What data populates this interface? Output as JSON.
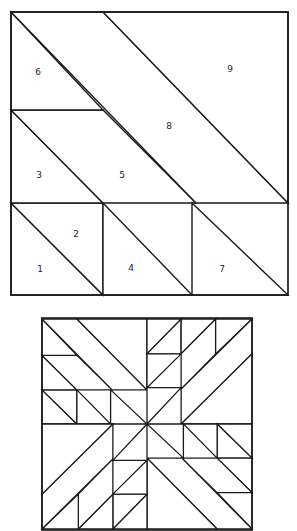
{
  "page": {
    "background_color": "#ffffff",
    "line_color": "#1a1a1a",
    "label_color": "#262626",
    "width": 297,
    "height": 531
  },
  "unit_block": {
    "name": "nine-piece-half-square-unit",
    "frame": {
      "x": 11,
      "y": 12,
      "width": 277,
      "height": 283
    },
    "label_font_size": 9,
    "pieces": [
      {
        "number": "1",
        "label_x": 40,
        "label_y": 269,
        "shape": "triangle",
        "points": "11,203 11,295 103,295"
      },
      {
        "number": "2",
        "label_x": 76,
        "label_y": 234,
        "shape": "triangle",
        "points": "11,203 103,203 103,295"
      },
      {
        "number": "3",
        "label_x": 39,
        "label_y": 175,
        "shape": "triangle",
        "points": "11,110 11,203 103,203"
      },
      {
        "number": "4",
        "label_x": 131,
        "label_y": 268,
        "shape": "triangle",
        "points": "103,203 192,295 103,295"
      },
      {
        "number": "5",
        "label_x": 122,
        "label_y": 175,
        "shape": "parallelogram",
        "points": "11,110 103,110 196,203 103,203"
      },
      {
        "number": "6",
        "label_x": 38,
        "label_y": 72,
        "shape": "triangle",
        "points": "11,12 103,110 11,110"
      },
      {
        "number": "7",
        "label_x": 222,
        "label_y": 269,
        "shape": "triangle",
        "points": "192,203 288,295 192,295"
      },
      {
        "number": "8",
        "label_x": 169,
        "label_y": 126,
        "shape": "parallelogram",
        "points": "11,12 103,12 288,203 196,203"
      },
      {
        "number": "9",
        "label_x": 230,
        "label_y": 69,
        "shape": "triangle",
        "points": "103,12 288,12 288,203"
      }
    ]
  },
  "quilt_block": {
    "name": "assembled-four-unit-block",
    "frame": {
      "x": 42,
      "y": 318,
      "width": 210,
      "height": 212
    },
    "center_x": 147,
    "center_y": 424,
    "units": 4,
    "description": "Four copies of the nine-piece unit rotated 90 degrees each around the block center, forming a concentric diamond pattern."
  },
  "caption": {
    "unit_label": "",
    "block_label": ""
  }
}
